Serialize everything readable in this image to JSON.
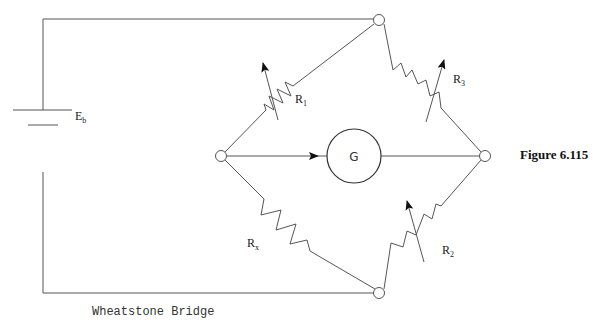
{
  "figure": {
    "title": "Figure 6.115",
    "caption": "Wheatstone Bridge"
  },
  "circuit": {
    "battery": {
      "label": "E",
      "subscript": "b"
    },
    "galvanometer": {
      "label": "G"
    },
    "resistors": [
      {
        "id": "R1",
        "label": "R",
        "subscript": "1",
        "position": "top-left",
        "variable": true
      },
      {
        "id": "R3",
        "label": "R",
        "subscript": "3",
        "position": "top-right",
        "variable": true
      },
      {
        "id": "Rx",
        "label": "R",
        "subscript": "x",
        "position": "bottom-left",
        "variable": false
      },
      {
        "id": "R2",
        "label": "R",
        "subscript": "2",
        "position": "bottom-right",
        "variable": true
      }
    ],
    "nodes": [
      "top",
      "left",
      "right",
      "bottom"
    ]
  },
  "colors": {
    "line": "#555555",
    "text": "#222222",
    "background": "#ffffff"
  }
}
